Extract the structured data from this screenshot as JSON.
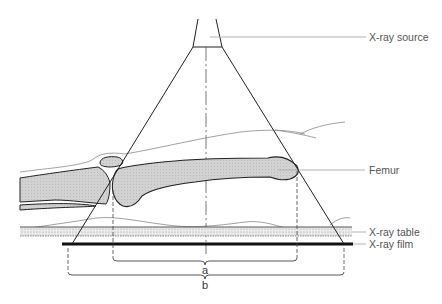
{
  "diagram": {
    "type": "radiography-geometry",
    "labels": {
      "source": "X-ray source",
      "femur": "Femur",
      "table": "X-ray table",
      "film": "X-ray film",
      "brace_a": "a",
      "brace_b": "b"
    },
    "colors": {
      "line": "#222222",
      "leader": "#999999",
      "bone_fill": "#d4d4d4",
      "table_fill": "#e0e0e0",
      "film": "#111111"
    }
  }
}
